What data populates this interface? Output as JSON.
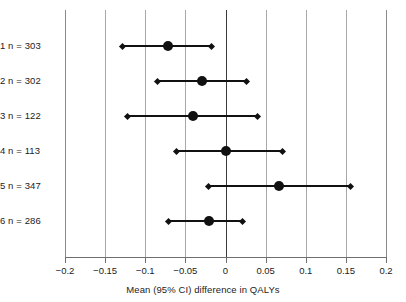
{
  "chart_data": {
    "type": "scatter",
    "title": "",
    "xlabel": "Mean (95% CI) difference in QALYs",
    "ylabel": "",
    "xlim": [
      -0.2,
      0.2
    ],
    "grid": true,
    "legend": "none",
    "zero_reference_line": 0,
    "xticks": [
      -0.2,
      -0.15,
      -0.1,
      -0.05,
      0,
      0.05,
      0.1,
      0.15,
      0.2
    ],
    "xtick_labels": [
      "−0.2",
      "−0.15",
      "−0.1",
      "−0.05",
      "0",
      "0.05",
      "0.1",
      "0.15",
      "0.2"
    ],
    "categories": [
      "1 n = 303",
      "2 n = 302",
      "3 n = 122",
      "4 n = 113",
      "5 n = 347",
      "6 n = 286"
    ],
    "rows": [
      {
        "label": "1 n = 303",
        "group": "1",
        "n": 303,
        "mean": -0.072,
        "ci_low": -0.128,
        "ci_high": -0.017
      },
      {
        "label": "2 n = 302",
        "group": "2",
        "n": 302,
        "mean": -0.029,
        "ci_low": -0.085,
        "ci_high": 0.026
      },
      {
        "label": "3 n = 122",
        "group": "3",
        "n": 122,
        "mean": -0.041,
        "ci_low": -0.122,
        "ci_high": 0.04
      },
      {
        "label": "4 n = 113",
        "group": "4",
        "n": 113,
        "mean": 0.0,
        "ci_low": -0.061,
        "ci_high": 0.071
      },
      {
        "label": "5 n = 347",
        "group": "5",
        "n": 347,
        "mean": 0.067,
        "ci_low": -0.021,
        "ci_high": 0.156
      },
      {
        "label": "6 n = 286",
        "group": "6",
        "n": 286,
        "mean": -0.021,
        "ci_low": -0.071,
        "ci_high": 0.021
      }
    ],
    "colors": {
      "marker": "#111111",
      "line": "#111111",
      "grid": "#a8a8a8",
      "zero_line": "#3a3a3a",
      "axis": "#6f6f6f",
      "text": "#1b1b1b",
      "background": "#ffffff"
    }
  }
}
